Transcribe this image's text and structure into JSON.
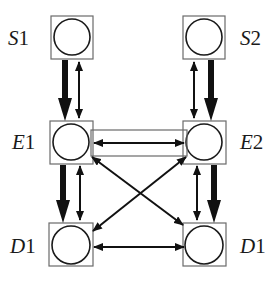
{
  "diagram": {
    "type": "network",
    "nodes": [
      {
        "id": "S1",
        "letter": "S",
        "index": "1",
        "col": "left",
        "row": "top"
      },
      {
        "id": "S2",
        "letter": "S",
        "index": "2",
        "col": "right",
        "row": "top"
      },
      {
        "id": "E1",
        "letter": "E",
        "index": "1",
        "col": "left",
        "row": "middle"
      },
      {
        "id": "E2",
        "letter": "E",
        "index": "2",
        "col": "right",
        "row": "middle"
      },
      {
        "id": "D1a",
        "letter": "D",
        "index": "1",
        "col": "left",
        "row": "bottom"
      },
      {
        "id": "D1b",
        "letter": "D",
        "index": "1",
        "col": "right",
        "row": "bottom"
      }
    ],
    "edges": [
      {
        "from": "S1",
        "to": "E1",
        "style": "thick",
        "direction": "forward"
      },
      {
        "from": "S1",
        "to": "E1",
        "style": "thin",
        "direction": "bidirectional"
      },
      {
        "from": "S2",
        "to": "E2",
        "style": "thick",
        "direction": "forward"
      },
      {
        "from": "S2",
        "to": "E2",
        "style": "thin",
        "direction": "bidirectional"
      },
      {
        "from": "E1",
        "to": "E2",
        "style": "thin",
        "direction": "bidirectional",
        "enclosed": true
      },
      {
        "from": "E1",
        "to": "D1a",
        "style": "thick",
        "direction": "forward"
      },
      {
        "from": "E1",
        "to": "D1a",
        "style": "thin",
        "direction": "bidirectional"
      },
      {
        "from": "E2",
        "to": "D1b",
        "style": "thick",
        "direction": "forward"
      },
      {
        "from": "E2",
        "to": "D1b",
        "style": "thin",
        "direction": "bidirectional"
      },
      {
        "from": "E1",
        "to": "D1b",
        "style": "thin",
        "direction": "bidirectional"
      },
      {
        "from": "E2",
        "to": "D1a",
        "style": "thin",
        "direction": "bidirectional"
      },
      {
        "from": "D1a",
        "to": "D1b",
        "style": "thin",
        "direction": "bidirectional"
      }
    ]
  },
  "labels": {
    "s1": {
      "letter": "S",
      "num": "1"
    },
    "s2": {
      "letter": "S",
      "num": "2"
    },
    "e1": {
      "letter": "E",
      "num": "1"
    },
    "e2": {
      "letter": "E",
      "num": "2"
    },
    "d1_left": {
      "letter": "D",
      "num": "1"
    },
    "d1_right": {
      "letter": "D",
      "num": "1"
    }
  }
}
